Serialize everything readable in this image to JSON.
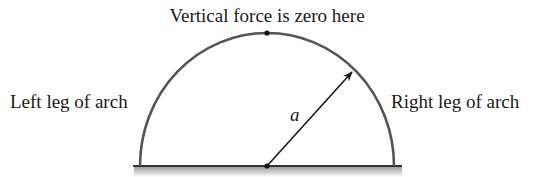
{
  "diagram": {
    "title_label": "Vertical force is zero here",
    "left_label": "Left leg of arch",
    "right_label": "Right leg of arch",
    "radius_label": "a",
    "colors": {
      "arch": "#555555",
      "ink": "#1a1a1a",
      "ground_shade": "#bdbdbd"
    }
  }
}
